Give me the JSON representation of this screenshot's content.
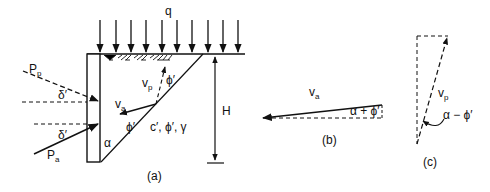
{
  "figure": {
    "panels": [
      {
        "id": "a",
        "caption": "(a)"
      },
      {
        "id": "b",
        "caption": "(b)"
      },
      {
        "id": "c",
        "caption": "(c)"
      }
    ],
    "labels": {
      "surcharge": "q",
      "passive_force": "P",
      "passive_sub": "p",
      "active_force": "P",
      "active_sub": "a",
      "wall_friction_upper": "δ′",
      "wall_friction_lower": "δ′",
      "velocity_active": "v",
      "velocity_active_sub": "a",
      "velocity_passive": "v",
      "velocity_passive_sub": "p",
      "phi_slip_active": "ϕ′",
      "phi_slip_passive": "ϕ′",
      "soil_params": "c′, ϕ′, γ",
      "wedge_angle": "α",
      "height": "H",
      "b_velocity": "v",
      "b_velocity_sub": "a",
      "b_angle": "α + ϕ′",
      "c_velocity": "v",
      "c_velocity_sub": "p",
      "c_angle": "α − ϕ′"
    },
    "colors": {
      "line": "#111111",
      "background": "#ffffff"
    }
  }
}
